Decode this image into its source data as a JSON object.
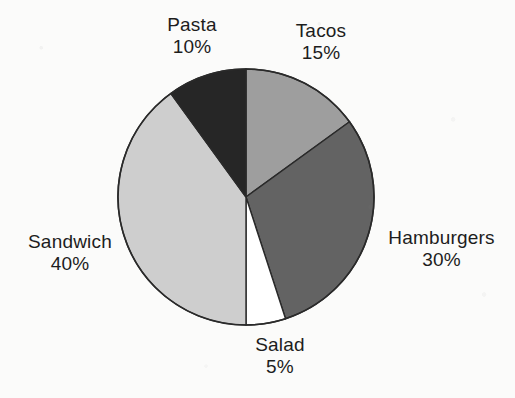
{
  "chart_data": {
    "type": "pie",
    "title": "",
    "subtitle": "",
    "xlabel": "",
    "ylabel": "",
    "legend_position": "none",
    "grid": false,
    "labels_format": "name + percentage, two lines, outside slices",
    "start_angle_deg": 0,
    "direction": "clockwise",
    "categories": [
      "Tacos",
      "Hamburgers",
      "Salad",
      "Sandwich",
      "Pasta"
    ],
    "values": [
      15,
      30,
      5,
      40,
      10
    ],
    "units": "%",
    "total": 100,
    "slices": [
      {
        "name": "Tacos",
        "value": 15,
        "percent_text": "15%",
        "color": "#9e9e9e",
        "start_deg": 0,
        "end_deg": 54,
        "label_position": "top-right"
      },
      {
        "name": "Hamburgers",
        "value": 30,
        "percent_text": "30%",
        "color": "#636363",
        "start_deg": 54,
        "end_deg": 162,
        "label_position": "right"
      },
      {
        "name": "Salad",
        "value": 5,
        "percent_text": "5%",
        "color": "#ffffff",
        "start_deg": 162,
        "end_deg": 180,
        "label_position": "bottom"
      },
      {
        "name": "Sandwich",
        "value": 40,
        "percent_text": "40%",
        "color": "#cecece",
        "start_deg": 180,
        "end_deg": 324,
        "label_position": "left"
      },
      {
        "name": "Pasta",
        "value": 10,
        "percent_text": "10%",
        "color": "#262626",
        "start_deg": 324,
        "end_deg": 360,
        "label_position": "top"
      }
    ]
  },
  "labels": {
    "pasta": {
      "name": "Pasta",
      "percent": "10%"
    },
    "tacos": {
      "name": "Tacos",
      "percent": "15%"
    },
    "hamburgers": {
      "name": "Hamburgers",
      "percent": "30%"
    },
    "salad": {
      "name": "Salad",
      "percent": "5%"
    },
    "sandwich": {
      "name": "Sandwich",
      "percent": "40%"
    }
  },
  "geometry": {
    "center_x": 246,
    "center_y": 197,
    "radius": 128,
    "outline_color": "#2a2a2a",
    "background_color": "#fbfbfa"
  }
}
